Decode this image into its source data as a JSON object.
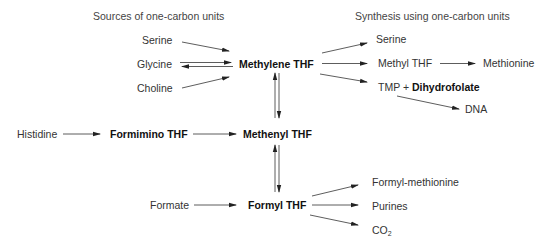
{
  "titles": {
    "sources": "Sources of one-carbon units",
    "synthesis": "Synthesis using one-carbon units"
  },
  "sources": {
    "serine": "Serine",
    "glycine": "Glycine",
    "choline": "Choline",
    "histidine": "Histidine",
    "formate": "Formate"
  },
  "intermediates": {
    "methylene_thf": "Methylene THF",
    "formimino_thf": "Formimino THF",
    "methenyl_thf": "Methenyl THF",
    "formyl_thf": "Formyl THF",
    "methyl_thf": "Methyl THF",
    "dihydrofolate": "Dihydrofolate"
  },
  "products": {
    "serine": "Serine",
    "methionine": "Methionine",
    "tmp": "TMP +",
    "dna": "DNA",
    "formyl_methionine": "Formyl-methionine",
    "purines": "Purines",
    "co2_base": "CO",
    "co2_sub": "2"
  },
  "edges": [
    {
      "from": "Serine",
      "to": "Methylene THF",
      "type": "forward"
    },
    {
      "from": "Glycine",
      "to": "Methylene THF",
      "type": "reversible"
    },
    {
      "from": "Choline",
      "to": "Methylene THF",
      "type": "forward"
    },
    {
      "from": "Methylene THF",
      "to": "Serine",
      "type": "forward"
    },
    {
      "from": "Methylene THF",
      "to": "Methyl THF",
      "type": "forward"
    },
    {
      "from": "Methyl THF",
      "to": "Methionine",
      "type": "forward"
    },
    {
      "from": "Methylene THF",
      "to": "TMP + Dihydrofolate",
      "type": "forward"
    },
    {
      "from": "TMP + Dihydrofolate",
      "to": "DNA",
      "type": "forward"
    },
    {
      "from": "Methylene THF",
      "to": "Methenyl THF",
      "type": "reversible"
    },
    {
      "from": "Histidine",
      "to": "Formimino THF",
      "type": "forward"
    },
    {
      "from": "Formimino THF",
      "to": "Methenyl THF",
      "type": "forward"
    },
    {
      "from": "Methenyl THF",
      "to": "Formyl THF",
      "type": "reversible"
    },
    {
      "from": "Formate",
      "to": "Formyl THF",
      "type": "forward"
    },
    {
      "from": "Formyl THF",
      "to": "Formyl-methionine",
      "type": "forward"
    },
    {
      "from": "Formyl THF",
      "to": "Purines",
      "type": "forward"
    },
    {
      "from": "Formyl THF",
      "to": "CO2",
      "type": "forward"
    }
  ],
  "colors": {
    "text": "#333333",
    "bold_text": "#111111",
    "arrow": "#222222",
    "background": "#ffffff"
  }
}
